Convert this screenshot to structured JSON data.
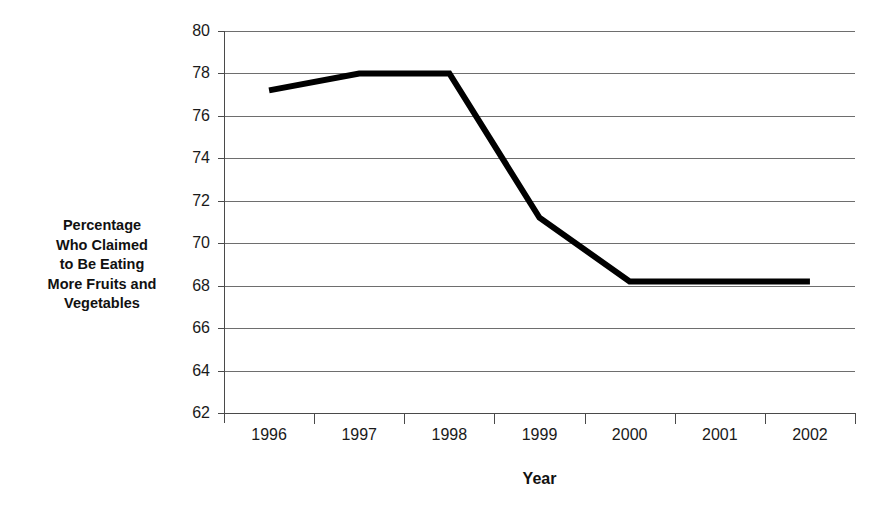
{
  "chart_data": {
    "type": "line",
    "title": "",
    "xlabel": "Year",
    "ylabel": "Percentage Who Claimed to Be Eating More Fruits and Vegetables",
    "ylabel_lines": [
      "Percentage",
      "Who Claimed",
      "to Be Eating",
      "More Fruits and",
      "Vegetables"
    ],
    "categories": [
      "1996",
      "1997",
      "1998",
      "1999",
      "2000",
      "2001",
      "2002"
    ],
    "series": [
      {
        "name": "Percentage Who Claimed to Be Eating More Fruits and Vegetables",
        "values": [
          77.2,
          78.0,
          78.0,
          71.2,
          68.2,
          68.2,
          68.2
        ],
        "color": "#000000",
        "line_width": 6
      }
    ],
    "ylim": [
      62,
      80
    ],
    "y_ticks": [
      80,
      78,
      76,
      74,
      72,
      70,
      68,
      66,
      64,
      62
    ],
    "y_tick_labels": [
      "80",
      "78",
      "76",
      "74",
      "72",
      "70",
      "68",
      "66",
      "64",
      "62"
    ],
    "grid": true,
    "grid_axis": "y",
    "legend": false,
    "legend_position": "none",
    "axis_color": "#4a4a4a",
    "grid_color": "#6e6e6e",
    "background": "#ffffff"
  }
}
